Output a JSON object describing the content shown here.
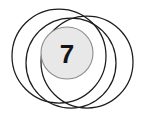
{
  "figure": {
    "type": "venn-diagram",
    "background_color": "#ffffff",
    "width": 141,
    "height": 119,
    "outline_color": "#1c1c1c",
    "outline_width": 1.25,
    "circles": [
      {
        "name": "circle-upper-left",
        "cx": 59,
        "cy": 56,
        "r": 47,
        "fill": "none",
        "stroke": "#1c1c1c"
      },
      {
        "name": "circle-lower-left",
        "cx": 71,
        "cy": 63,
        "r": 45,
        "fill": "none",
        "stroke": "#1c1c1c"
      },
      {
        "name": "circle-right",
        "cx": 87,
        "cy": 62,
        "r": 46,
        "fill": "none",
        "stroke": "#1c1c1c"
      }
    ],
    "filled_disc": {
      "name": "center-disc",
      "cx": 67,
      "cy": 53,
      "r": 26,
      "fill_color": "#e8e8e8",
      "stroke_color": "#8d8d8d",
      "label": "7"
    }
  }
}
